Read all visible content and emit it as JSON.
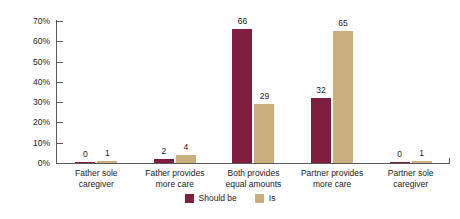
{
  "chart_data": {
    "type": "bar",
    "title": "",
    "subtitle": "",
    "xlabel": "",
    "ylabel": "",
    "ylim": [
      0,
      70
    ],
    "ytick_labels": [
      "0%",
      "10%",
      "20%",
      "30%",
      "40%",
      "50%",
      "60%",
      "70%"
    ],
    "ytick_values": [
      0,
      10,
      20,
      30,
      40,
      50,
      60,
      70
    ],
    "grid": false,
    "legend_position": "bottom",
    "categories": [
      "Father sole caregiver",
      "Father provides more care",
      "Both provides equal amounts",
      "Partner provides more care",
      "Partner sole caregiver"
    ],
    "category_lines": [
      [
        "Father sole",
        "caregiver"
      ],
      [
        "Father provides",
        "more care"
      ],
      [
        "Both provides",
        "equal amounts"
      ],
      [
        "Partner provides",
        "more care"
      ],
      [
        "Partner sole",
        "caregiver"
      ]
    ],
    "series": [
      {
        "name": "Should be",
        "color": "#7e1f3d",
        "values": [
          0,
          2,
          66,
          32,
          0
        ],
        "value_labels": [
          "0",
          "2",
          "66",
          "32",
          "0"
        ]
      },
      {
        "name": "Is",
        "color": "#caaf7c",
        "values": [
          1,
          4,
          29,
          65,
          1
        ],
        "value_labels": [
          "1",
          "4",
          "29",
          "65",
          "1"
        ]
      }
    ]
  },
  "legend": {
    "items": [
      {
        "label": "Should be",
        "color": "#7e1f3d"
      },
      {
        "label": "Is",
        "color": "#caaf7c"
      }
    ]
  },
  "axis": {
    "line_color": "#5a5a5a"
  }
}
